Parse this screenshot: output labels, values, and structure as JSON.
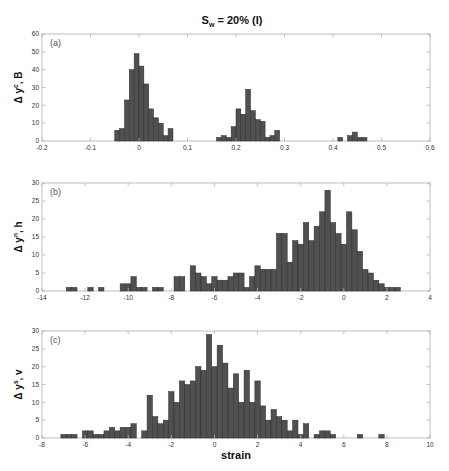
{
  "figure": {
    "title_main": "S",
    "title_sub": "w",
    "title_rest": " = 20% (I)",
    "xlabel": "strain",
    "bar_color": "#505050",
    "bar_edge": "#2a2a2a",
    "axis_color": "#b0b0b0",
    "tick_label_color": "#333333"
  },
  "chart_data": [
    {
      "type": "bar",
      "panel_label": "(a)",
      "ylabel_prefix": "Δ y",
      "ylabel_sup": "c",
      "ylabel_suffix": ", B",
      "xlim": [
        -0.2,
        0.6
      ],
      "ylim": [
        0,
        60
      ],
      "xticks": [
        -0.2,
        -0.1,
        0,
        0.1,
        0.2,
        0.3,
        0.4,
        0.5,
        0.6
      ],
      "xtick_labels": [
        "-0.2",
        "-0.1",
        "0",
        "0.1",
        "0.2",
        "0.3",
        "0.4",
        "0.5",
        "0.6"
      ],
      "yticks": [
        0,
        10,
        20,
        30,
        40,
        50,
        60
      ],
      "bin_width": 0.01,
      "x": [
        -0.045,
        -0.035,
        -0.025,
        -0.015,
        -0.005,
        0.005,
        0.015,
        0.025,
        0.035,
        0.045,
        0.055,
        0.065,
        0.165,
        0.175,
        0.185,
        0.195,
        0.205,
        0.215,
        0.225,
        0.235,
        0.245,
        0.255,
        0.265,
        0.275,
        0.285,
        0.415,
        0.435,
        0.445,
        0.455,
        0.465
      ],
      "values": [
        6,
        7,
        23,
        40,
        49,
        42,
        32,
        18,
        13,
        10,
        3,
        7,
        2,
        3,
        2,
        8,
        18,
        15,
        29,
        17,
        12,
        11,
        2,
        3,
        6,
        2,
        3,
        5,
        2,
        2
      ],
      "grid": false
    },
    {
      "type": "bar",
      "panel_label": "(b)",
      "ylabel_prefix": "Δ y",
      "ylabel_sup": "n",
      "ylabel_suffix": ", h",
      "xlim": [
        -14,
        4
      ],
      "ylim": [
        0,
        30
      ],
      "xticks": [
        -14,
        -12,
        -10,
        -8,
        -6,
        -4,
        -2,
        0,
        2,
        4
      ],
      "xtick_labels": [
        "-14",
        "-12",
        "-10",
        "-8",
        "-6",
        "-4",
        "-2",
        "0",
        "2",
        "4"
      ],
      "yticks": [
        0,
        5,
        10,
        15,
        20,
        25,
        30
      ],
      "bin_width": 0.25,
      "x": [
        -12.75,
        -12.5,
        -11.75,
        -11.25,
        -10.25,
        -10,
        -9.75,
        -9.5,
        -9.25,
        -8.75,
        -8.5,
        -7.75,
        -7.5,
        -7,
        -6.75,
        -6.5,
        -6.25,
        -6,
        -5.75,
        -5.5,
        -5.25,
        -5,
        -4.75,
        -4.5,
        -4.25,
        -4,
        -3.75,
        -3.5,
        -3.25,
        -3,
        -2.75,
        -2.5,
        -2.25,
        -2,
        -1.75,
        -1.5,
        -1.25,
        -1,
        -0.75,
        -0.5,
        -0.25,
        0,
        0.25,
        0.5,
        0.75,
        1,
        1.25,
        1.5,
        1.75,
        2,
        2.25,
        2.5
      ],
      "values": [
        1,
        1,
        1,
        1,
        2,
        2,
        4,
        1,
        1,
        1,
        1,
        4,
        4,
        7,
        5,
        4,
        2,
        4,
        3,
        3,
        4,
        5,
        5,
        1,
        4,
        7,
        6,
        6,
        6,
        16,
        16,
        8,
        14,
        13,
        19,
        14,
        18,
        22,
        28,
        19,
        16,
        13,
        22,
        17,
        11,
        6,
        5,
        3,
        2,
        1,
        1,
        1
      ],
      "grid": false
    },
    {
      "type": "bar",
      "panel_label": "(c)",
      "ylabel_prefix": "Δ y",
      "ylabel_sup": "s",
      "ylabel_suffix": ", v",
      "xlim": [
        -8,
        10
      ],
      "ylim": [
        0,
        30
      ],
      "xticks": [
        -8,
        -6,
        -4,
        -2,
        0,
        2,
        4,
        6,
        8,
        10
      ],
      "xtick_labels": [
        "-8",
        "-6",
        "-4",
        "-2",
        "0",
        "2",
        "4",
        "6",
        "8",
        "10"
      ],
      "yticks": [
        0,
        5,
        10,
        15,
        20,
        25,
        30
      ],
      "xlabel": "strain",
      "bin_width": 0.25,
      "x": [
        -7,
        -6.75,
        -6.5,
        -6,
        -5.75,
        -5.5,
        -5.25,
        -5,
        -4.75,
        -4.5,
        -4.25,
        -4,
        -3.75,
        -3.25,
        -3,
        -2.75,
        -2.5,
        -2.25,
        -2,
        -1.75,
        -1.5,
        -1.25,
        -1,
        -0.75,
        -0.5,
        -0.25,
        0,
        0.25,
        0.5,
        0.75,
        1,
        1.25,
        1.5,
        1.75,
        2,
        2.25,
        2.5,
        2.75,
        3,
        3.25,
        3.5,
        3.75,
        4,
        4.25,
        4.75,
        5,
        5.25,
        5.5,
        6.75,
        7.75
      ],
      "values": [
        1,
        1,
        1,
        2,
        2,
        1,
        1,
        2,
        3,
        2,
        3,
        3,
        4,
        2,
        12,
        6,
        4,
        5,
        13,
        10,
        16,
        15,
        16,
        20,
        19,
        29,
        20,
        26,
        21,
        14,
        18,
        10,
        19,
        10,
        16,
        9,
        5,
        8,
        6,
        5,
        2,
        5,
        1,
        4,
        1,
        2,
        2,
        1,
        1,
        1
      ],
      "grid": false
    }
  ],
  "caption": {
    "text": ""
  }
}
